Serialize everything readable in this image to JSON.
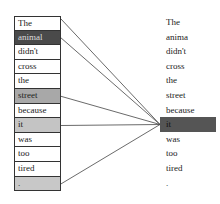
{
  "diagram": {
    "type": "attention-visualization",
    "left_tokens": [
      {
        "text": "The",
        "weight": 0.0,
        "fill": "#ffffff"
      },
      {
        "text": "animal",
        "weight": 0.9,
        "fill": "#4a4a4a"
      },
      {
        "text": "didn't",
        "weight": 0.0,
        "fill": "#ffffff"
      },
      {
        "text": "cross",
        "weight": 0.0,
        "fill": "#ffffff"
      },
      {
        "text": "the",
        "weight": 0.0,
        "fill": "#ffffff"
      },
      {
        "text": "street",
        "weight": 0.4,
        "fill": "#a8a8a8"
      },
      {
        "text": "because",
        "weight": 0.0,
        "fill": "#ffffff"
      },
      {
        "text": "it",
        "weight": 0.3,
        "fill": "#c4c4c4"
      },
      {
        "text": "was",
        "weight": 0.0,
        "fill": "#ffffff"
      },
      {
        "text": "too",
        "weight": 0.0,
        "fill": "#ffffff"
      },
      {
        "text": "tired",
        "weight": 0.0,
        "fill": "#ffffff"
      },
      {
        "text": ".",
        "weight": 0.25,
        "fill": "#c8c8c8"
      }
    ],
    "right_tokens": [
      {
        "text": "The",
        "highlight": false
      },
      {
        "text": "anima",
        "highlight": false
      },
      {
        "text": "didn't",
        "highlight": false
      },
      {
        "text": "cross",
        "highlight": false
      },
      {
        "text": "the",
        "highlight": false
      },
      {
        "text": "street",
        "highlight": false
      },
      {
        "text": "because",
        "highlight": false
      },
      {
        "text": "it",
        "highlight": true
      },
      {
        "text": "was",
        "highlight": false
      },
      {
        "text": "too",
        "highlight": false
      },
      {
        "text": "tired",
        "highlight": false
      },
      {
        "text": ".",
        "highlight": false
      }
    ],
    "highlight_color": "#555555",
    "query_token_index": 7,
    "links_from_left_indices": [
      0,
      1,
      5,
      7,
      11
    ],
    "line_color": "#444444"
  }
}
